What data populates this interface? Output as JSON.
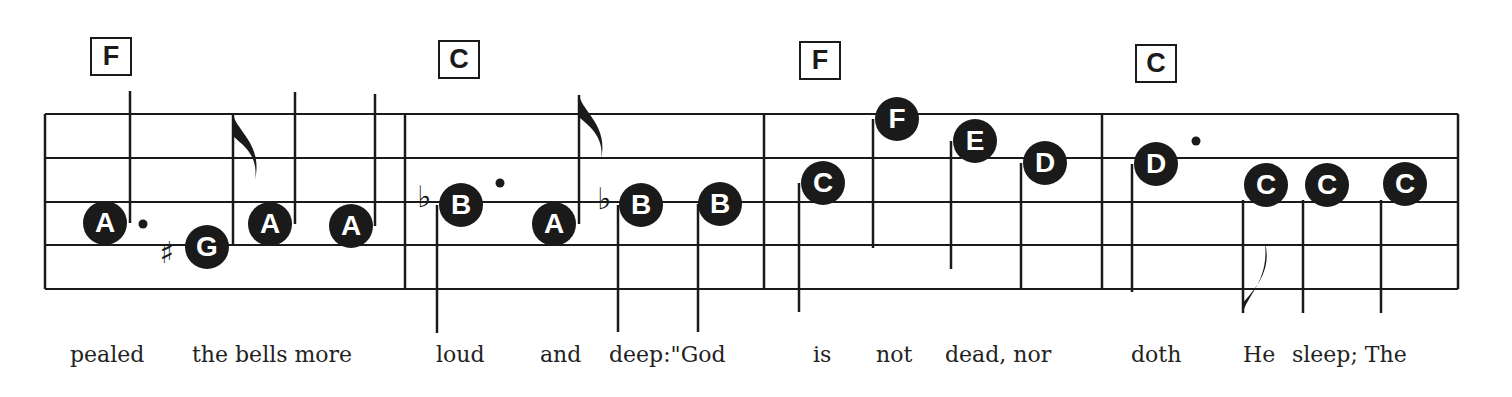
{
  "staff": {
    "left": 45,
    "right": 1458,
    "lines_y": [
      114,
      158,
      202,
      245,
      289
    ],
    "barlines_x": [
      45,
      405,
      764,
      1102,
      1458
    ]
  },
  "measures": [
    {
      "chord": "F",
      "chord_box": {
        "x": 90,
        "y": 37
      },
      "notes": [
        {
          "letter": "A",
          "x": 105,
          "y": 223,
          "stem": {
            "x": 130,
            "y1": 91,
            "y2": 223
          },
          "dotted": true,
          "dot": {
            "x": 143,
            "y": 224
          }
        },
        {
          "letter": "G",
          "x": 207,
          "y": 247,
          "accidental": "♯",
          "acc_x": 167,
          "acc_y": 252
        },
        {
          "letter": "A",
          "x": 270,
          "y": 224,
          "stem": {
            "x": 295,
            "y1": 92,
            "y2": 224
          }
        },
        {
          "letter": "A",
          "x": 351,
          "y": 226,
          "stem": {
            "x": 375,
            "y1": 94,
            "y2": 226
          }
        }
      ],
      "extra_stems": [
        {
          "x": 233,
          "y1": 114,
          "y2": 245,
          "flag": "up"
        }
      ]
    },
    {
      "chord": "C",
      "chord_box": {
        "x": 438,
        "y": 40
      },
      "notes": [
        {
          "letter": "B",
          "x": 461,
          "y": 205,
          "accidental": "♭",
          "acc_x": 424,
          "acc_y": 196,
          "stem": {
            "x": 437,
            "y1": 205,
            "y2": 333
          },
          "dotted": true,
          "dot": {
            "x": 500,
            "y": 183
          }
        },
        {
          "letter": "A",
          "x": 554,
          "y": 224,
          "stem": {
            "x": 579,
            "y1": 95,
            "y2": 224
          },
          "flag": "up"
        },
        {
          "letter": "B",
          "x": 641,
          "y": 205,
          "accidental": "♭",
          "acc_x": 604,
          "acc_y": 198,
          "stem": {
            "x": 618,
            "y1": 205,
            "y2": 332
          }
        },
        {
          "letter": "B",
          "x": 720,
          "y": 204,
          "stem": {
            "x": 698,
            "y1": 204,
            "y2": 332
          }
        }
      ]
    },
    {
      "chord": "F",
      "chord_box": {
        "x": 799,
        "y": 41
      },
      "notes": [
        {
          "letter": "C",
          "x": 823,
          "y": 183,
          "stem": {
            "x": 799,
            "y1": 183,
            "y2": 312
          }
        },
        {
          "letter": "F",
          "x": 897,
          "y": 119,
          "stem": {
            "x": 873,
            "y1": 119,
            "y2": 248
          }
        },
        {
          "letter": "E",
          "x": 975,
          "y": 141,
          "stem": {
            "x": 951,
            "y1": 141,
            "y2": 269
          }
        },
        {
          "letter": "D",
          "x": 1045,
          "y": 163,
          "stem": {
            "x": 1021,
            "y1": 163,
            "y2": 290
          }
        }
      ]
    },
    {
      "chord": "C",
      "chord_box": {
        "x": 1135,
        "y": 44
      },
      "notes": [
        {
          "letter": "D",
          "x": 1156,
          "y": 164,
          "stem": {
            "x": 1132,
            "y1": 164,
            "y2": 292
          },
          "dotted": true,
          "dot": {
            "x": 1196,
            "y": 141
          }
        },
        {
          "letter": "C",
          "x": 1266,
          "y": 185,
          "stem": {
            "x": 1243,
            "y1": 200,
            "y2": 313
          },
          "flag": "down"
        },
        {
          "letter": "C",
          "x": 1327,
          "y": 185,
          "stem": {
            "x": 1303,
            "y1": 200,
            "y2": 313
          }
        },
        {
          "letter": "C",
          "x": 1405,
          "y": 184,
          "stem": {
            "x": 1381,
            "y1": 200,
            "y2": 313
          }
        }
      ]
    }
  ],
  "lyrics": [
    {
      "text": "pealed",
      "x": 70
    },
    {
      "text": "the bells more",
      "x": 192
    },
    {
      "text": "loud",
      "x": 436
    },
    {
      "text": "and",
      "x": 540
    },
    {
      "text": "deep:\"God",
      "x": 609
    },
    {
      "text": "is",
      "x": 813
    },
    {
      "text": "not",
      "x": 876
    },
    {
      "text": "dead, nor",
      "x": 945
    },
    {
      "text": "doth",
      "x": 1131
    },
    {
      "text": "He",
      "x": 1243
    },
    {
      "text": "sleep; The",
      "x": 1292
    }
  ],
  "colors": {
    "ink": "#1a1a1a",
    "paper": "#ffffff"
  }
}
